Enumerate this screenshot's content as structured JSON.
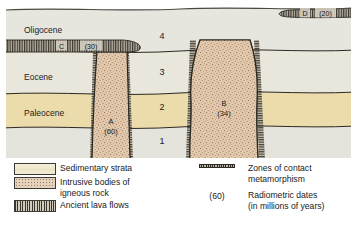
{
  "figure": {
    "type": "geologic-cross-section",
    "title": "",
    "colors": {
      "sedimentary_light": "#e4e3dc",
      "sedimentary_tan": "#ecdcac",
      "igneous_intrusive": "#e0c6ac",
      "lava_flow_dark": "#4a453c",
      "outline": "#2b2820",
      "contact_zone": "#2e2b25",
      "background": "#ffffff"
    }
  },
  "cross_section": {
    "era_labels": [
      {
        "name": "Oligocene",
        "x": 24,
        "y": 30
      },
      {
        "name": "Eocene",
        "x": 24,
        "y": 78
      },
      {
        "name": "Paleocene",
        "x": 24,
        "y": 113
      }
    ],
    "layer_numbers": [
      {
        "label": "4",
        "x": 162,
        "y": 36
      },
      {
        "label": "3",
        "x": 162,
        "y": 72
      },
      {
        "label": "2",
        "x": 162,
        "y": 106
      },
      {
        "label": "1",
        "x": 162,
        "y": 140
      }
    ],
    "intrusive_bodies": [
      {
        "id": "A",
        "date": "(60)",
        "label_x": 110,
        "label_y": 123
      },
      {
        "id": "B",
        "date": "(34)",
        "label_x": 225,
        "label_y": 110
      }
    ],
    "lava_flows": [
      {
        "id": "C",
        "date": "(30)",
        "label_x": 63,
        "label_y": 47,
        "date_x": 92,
        "date_y": 47
      },
      {
        "id": "D",
        "date": "(20)",
        "label_x": 305,
        "label_y": 14,
        "date_x": 325,
        "date_y": 14
      }
    ]
  },
  "legend": {
    "left_items": [
      {
        "swatch": "sedimentary-strata-swatch",
        "label": "Sedimentary strata",
        "sub": ""
      },
      {
        "swatch": "igneous-rock-swatch",
        "label": "Intrusive bodies of",
        "sub": "igneous rock"
      },
      {
        "swatch": "lava-flow-swatch",
        "label": "Ancient lava flows",
        "sub": ""
      }
    ],
    "right_items": [
      {
        "key": "zone-line",
        "key_text": "",
        "label": "Zones of contact metamorphism",
        "sub": ""
      },
      {
        "key": "date-text",
        "key_text": "(60)",
        "label": "Radiometric dates",
        "sub": "(in millions of years)"
      }
    ]
  }
}
